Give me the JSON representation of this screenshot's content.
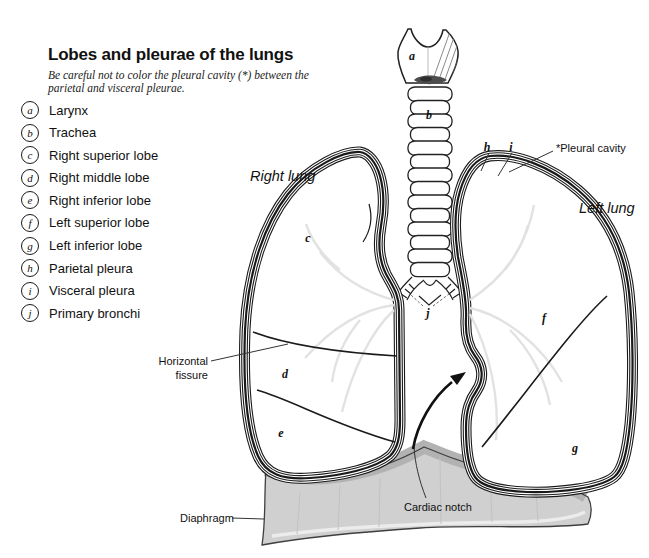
{
  "page": {
    "title": "Lobes and pleurae of the lungs",
    "subtitle_line1": "Be careful not to color the pleural cavity (*) between the",
    "subtitle_line2": "parietal and visceral pleurae."
  },
  "legend": {
    "items": [
      {
        "letter": "a",
        "label": "Larynx"
      },
      {
        "letter": "b",
        "label": "Trachea"
      },
      {
        "letter": "c",
        "label": "Right superior lobe"
      },
      {
        "letter": "d",
        "label": "Right middle lobe"
      },
      {
        "letter": "e",
        "label": "Right inferior lobe"
      },
      {
        "letter": "f",
        "label": "Left superior lobe"
      },
      {
        "letter": "g",
        "label": "Left inferior lobe"
      },
      {
        "letter": "h",
        "label": "Parietal pleura"
      },
      {
        "letter": "i",
        "label": "Visceral pleura"
      },
      {
        "letter": "j",
        "label": "Primary bronchi"
      }
    ]
  },
  "diagram": {
    "labels": {
      "right_lung": "Right lung",
      "left_lung": "Left lung",
      "pleural_cavity": "*Pleural cavity",
      "horizontal_fissure_line1": "Horizontal",
      "horizontal_fissure_line2": "fissure",
      "diaphragm": "Diaphragm",
      "cardiac_notch": "Cardiac notch"
    },
    "markers": {
      "a": "a",
      "b": "b",
      "c": "c",
      "d": "d",
      "e": "e",
      "f": "f",
      "g": "g",
      "h": "h",
      "i": "i",
      "j": "j"
    }
  },
  "colors": {
    "ink": "#1a1a1a",
    "paper": "#ffffff",
    "diaphragm_fill": "#d0d0d0",
    "diaphragm_shade": "#b2b2b2",
    "larynx_shadow": "#4d4d4d",
    "bronchial_faint": "#e2e2e2"
  }
}
